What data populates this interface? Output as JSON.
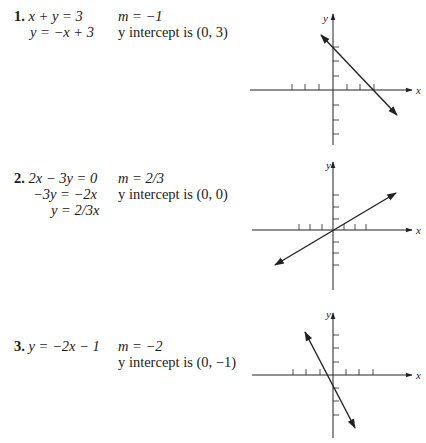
{
  "problems": [
    {
      "number": "1.",
      "equations": [
        "x + y = 3",
        "y = −x + 3"
      ],
      "slope": "m = −1",
      "intercept": "y intercept is (0, 3)",
      "graph": {
        "origin": [
          333,
          90
        ],
        "tick_spacing": 13,
        "x_label": "x",
        "y_label": "y",
        "line": {
          "slope": -1,
          "y_intercept": 3,
          "from": [
            321,
            35
          ],
          "to": [
            397,
            115
          ]
        }
      }
    },
    {
      "number": "2.",
      "equations": [
        "2x − 3y = 0",
        "−3y = −2x",
        "y = 2/3x"
      ],
      "slope": "m = 2/3",
      "intercept": "y intercept is (0, 0)",
      "graph": {
        "origin": [
          333,
          230
        ],
        "tick_spacing": 11.5,
        "x_label": "x",
        "y_label": "y",
        "line": {
          "slope": 0.6667,
          "y_intercept": 0,
          "from": [
            275,
            265
          ],
          "to": [
            396,
            193
          ]
        }
      }
    },
    {
      "number": "3.",
      "equations": [
        "y = −2x − 1"
      ],
      "slope": "m = −2",
      "intercept": "y intercept is (0, −1)",
      "graph": {
        "origin": [
          333,
          375
        ],
        "tick_spacing": 13,
        "x_label": "x",
        "y_label": "y",
        "line": {
          "slope": -2,
          "y_intercept": -1,
          "from": [
            305,
            332
          ],
          "to": [
            355,
            428
          ]
        }
      }
    }
  ]
}
